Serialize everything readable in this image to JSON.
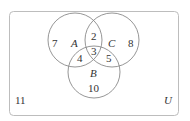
{
  "diagram": {
    "type": "venn",
    "universe_label": "U",
    "sets": [
      {
        "name": "A"
      },
      {
        "name": "B"
      },
      {
        "name": "C"
      }
    ],
    "regions": {
      "A_only": "7",
      "C_only": "8",
      "B_only": "10",
      "A_and_C_only": "2",
      "A_and_B_only": "4",
      "B_and_C_only": "5",
      "A_B_C": "3",
      "outside": "11"
    },
    "colors": {
      "stroke": "#8a8a8a",
      "text": "#333333",
      "frame": "#bbbbbb"
    }
  }
}
